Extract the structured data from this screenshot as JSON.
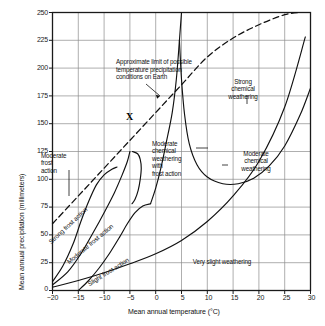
{
  "chart_data": {
    "type": "line",
    "title": "",
    "xlabel": "Mean annual temperature (°C)",
    "ylabel": "Mean annual precipitation (millimeters)",
    "xlim": [
      -20,
      30
    ],
    "ylim": [
      0,
      250
    ],
    "xticks": [
      "−20",
      "−15",
      "−10",
      "−5",
      "0",
      "5",
      "10",
      "15",
      "20",
      "25",
      "30"
    ],
    "xtick_values": [
      -20,
      -15,
      -10,
      -5,
      0,
      5,
      10,
      15,
      20,
      25,
      30
    ],
    "yticks": [
      "0",
      "25",
      "50",
      "75",
      "100",
      "125",
      "150",
      "175",
      "200",
      "225",
      "250"
    ],
    "ytick_values": [
      0,
      25,
      50,
      75,
      100,
      125,
      150,
      175,
      200,
      225,
      250
    ],
    "grid": true,
    "legend": "none",
    "series": [
      {
        "name": "Approximate limit of possible temperature precipitation conditions on Earth",
        "style": "dashed",
        "points": [
          [
            -20,
            60
          ],
          [
            -15,
            85
          ],
          [
            -10,
            110
          ],
          [
            -5,
            135
          ],
          [
            0,
            160
          ],
          [
            5,
            185
          ],
          [
            10,
            210
          ],
          [
            15,
            227
          ],
          [
            20,
            239
          ],
          [
            25,
            248
          ],
          [
            28,
            250
          ]
        ]
      },
      {
        "name": "Strong frost action boundary",
        "style": "solid",
        "points": [
          [
            -20,
            8
          ],
          [
            -18,
            22
          ],
          [
            -16,
            42
          ],
          [
            -14.5,
            62
          ],
          [
            -13,
            80
          ],
          [
            -11.5,
            95
          ],
          [
            -10,
            104
          ],
          [
            -8.5,
            109
          ],
          [
            -7.5,
            111
          ]
        ]
      },
      {
        "name": "Moderate frost action boundary",
        "style": "solid",
        "points": [
          [
            -20,
            5
          ],
          [
            -17,
            17
          ],
          [
            -14.5,
            33
          ],
          [
            -12,
            53
          ],
          [
            -10,
            70
          ],
          [
            -8,
            88
          ],
          [
            -6.5,
            104
          ],
          [
            -5.5,
            116
          ],
          [
            -5,
            125
          ]
        ]
      },
      {
        "name": "Slight frost action boundary",
        "style": "solid",
        "points": [
          [
            -15,
            0
          ],
          [
            -13,
            9
          ],
          [
            -11,
            20
          ],
          [
            -9,
            33
          ],
          [
            -7,
            48
          ],
          [
            -5.5,
            60
          ],
          [
            -4,
            70
          ],
          [
            -2.5,
            76
          ],
          [
            -1,
            78
          ]
        ]
      },
      {
        "name": "Very slight weathering boundary",
        "style": "solid",
        "points": [
          [
            -20,
            3
          ],
          [
            -15,
            9
          ],
          [
            -10,
            16
          ],
          [
            -5,
            24
          ],
          [
            0,
            33
          ],
          [
            5,
            45
          ],
          [
            10,
            62
          ],
          [
            15,
            85
          ],
          [
            20,
            116
          ],
          [
            25,
            165
          ],
          [
            29,
            228
          ]
        ]
      },
      {
        "name": "Moderate chemical weathering inner boundary",
        "style": "solid",
        "points": [
          [
            -1,
            78
          ],
          [
            0,
            92
          ],
          [
            1,
            110
          ],
          [
            2,
            132
          ],
          [
            3.2,
            160
          ],
          [
            4,
            190
          ],
          [
            4.6,
            225
          ],
          [
            5,
            250
          ]
        ]
      },
      {
        "name": "Moderate / strong chemical weathering boundary",
        "style": "solid",
        "points": [
          [
            -4.5,
            125
          ],
          [
            -3.5,
            123
          ],
          [
            -3,
            118
          ],
          [
            -2.8,
            110
          ],
          [
            -3,
            100
          ],
          [
            -3.4,
            90
          ],
          [
            -4,
            82
          ],
          [
            -4.6,
            78
          ]
        ]
      },
      {
        "name": "Strong chemical weathering lower boundary",
        "style": "solid",
        "points": [
          [
            4.6,
            225
          ],
          [
            5,
            190
          ],
          [
            5.6,
            158
          ],
          [
            6.5,
            132
          ],
          [
            8,
            113
          ],
          [
            10,
            102
          ],
          [
            13,
            96
          ],
          [
            16,
            96
          ],
          [
            19,
            101
          ],
          [
            22,
            112
          ],
          [
            25,
            130
          ],
          [
            28,
            158
          ],
          [
            30,
            182
          ]
        ]
      }
    ],
    "annotations": [
      {
        "name": "earth-limit-annotation",
        "text": "Approximate limit of possible\ntemperature precipitation\nconditions on Earth",
        "x": -5.5,
        "y": 205
      },
      {
        "name": "point-x-marker",
        "text": "X",
        "x": -5,
        "y": 160
      }
    ],
    "region_labels": [
      {
        "name": "moderate-frost-action",
        "text": "Moderate\nfrost\naction",
        "x": -16.5,
        "y": 117
      },
      {
        "name": "strong-frost-action",
        "text": "Strong frost action",
        "x": -16,
        "y": 52,
        "rotation": -43
      },
      {
        "name": "moderate-frost-action-diagonal",
        "text": "Moderate frost action",
        "x": -13,
        "y": 32,
        "rotation": -40
      },
      {
        "name": "slight-frost-action",
        "text": "Slight frost action",
        "x": -9.5,
        "y": 13,
        "rotation": -32
      },
      {
        "name": "moderate-chemical-weathering-with-frost-action",
        "text": "Moderate\nchemical\nweathering\nwith\nfrost action",
        "x": -2.5,
        "y": 130
      },
      {
        "name": "strong-chemical-weathering",
        "text": "Strong\nchemical\nweathering",
        "x": 12.5,
        "y": 182
      },
      {
        "name": "moderate-chemical-weathering",
        "text": "Moderate\nchemical\nweathering",
        "x": 20.5,
        "y": 118
      },
      {
        "name": "very-slight-weathering",
        "text": "Very slight weathering",
        "x": 15,
        "y": 28
      }
    ]
  },
  "axes": {
    "x_title": "Mean annual temperature (°C)",
    "y_title": "Mean annual precipitation (millimeters)"
  },
  "colors": {
    "line": "#111111",
    "grid": "#8d8d8d",
    "frame": "#1a1a1a",
    "background": "#ffffff",
    "text": "#111111"
  }
}
